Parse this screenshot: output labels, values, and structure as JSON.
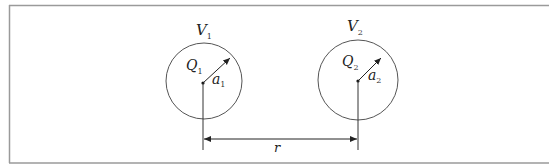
{
  "diagram": {
    "sphere1": {
      "volume_label": "V",
      "volume_sub": "1",
      "charge_label": "Q",
      "charge_sub": "1",
      "radius_label": "a",
      "radius_sub": "1"
    },
    "sphere2": {
      "volume_label": "V",
      "volume_sub": "2",
      "charge_label": "Q",
      "charge_sub": "2",
      "radius_label": "a",
      "radius_sub": "2"
    },
    "distance_label": "r",
    "colors": {
      "stroke": "#333333",
      "frame": "#9a9a9a",
      "background": "#ffffff"
    }
  }
}
